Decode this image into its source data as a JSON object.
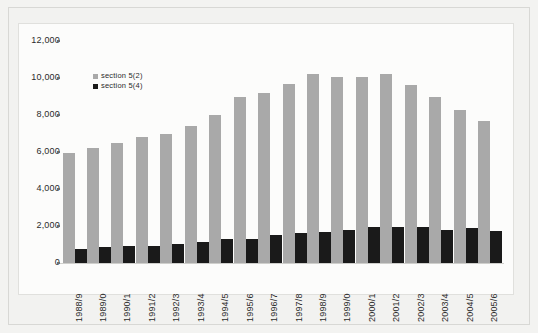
{
  "chart_data": {
    "type": "bar",
    "title": "",
    "subtitle": "",
    "xlabel": "",
    "ylabel": "",
    "ylim": [
      0,
      12000
    ],
    "ytick_labels": [
      "12,000",
      "10,000",
      "8,000",
      "6,000",
      "4,000",
      "2,000",
      "0"
    ],
    "yticks": [
      12000,
      10000,
      8000,
      6000,
      4000,
      2000,
      0
    ],
    "grid": false,
    "legend_position": "inside-top-left",
    "bar_mode": "grouped",
    "categories": [
      "1988/9",
      "1989/0",
      "1990/1",
      "1991/2",
      "1992/3",
      "1993/4",
      "1994/5",
      "1995/6",
      "1996/7",
      "1997/8",
      "1998/9",
      "1999/0",
      "2000/1",
      "2001/2",
      "2002/3",
      "2003/4",
      "2004/5",
      "2005/6"
    ],
    "series": [
      {
        "name": "section 5(2)",
        "color": "#a9a9a9",
        "values": [
          5950,
          6200,
          6500,
          6800,
          7000,
          7400,
          8000,
          8950,
          9200,
          9650,
          10200,
          10050,
          10050,
          10200,
          9600,
          8950,
          8250,
          7650
        ]
      },
      {
        "name": "section 5(4)",
        "color": "#1a1a1a",
        "values": [
          780,
          860,
          930,
          930,
          1050,
          1120,
          1300,
          1300,
          1500,
          1620,
          1700,
          1790,
          1950,
          1950,
          1950,
          1800,
          1870,
          1720
        ]
      }
    ]
  },
  "legend": {
    "items": [
      {
        "label": "section 5(2)",
        "color": "#a9a9a9"
      },
      {
        "label": "section 5(4)",
        "color": "#1a1a1a"
      }
    ]
  },
  "colors": {
    "series_grey": "#a9a9a9",
    "series_black": "#1a1a1a",
    "page_background": "#f3f3f1",
    "panel_background": "#fcfcfb",
    "panel_border": "#e0e0dd",
    "text": "#2b2b2b"
  }
}
